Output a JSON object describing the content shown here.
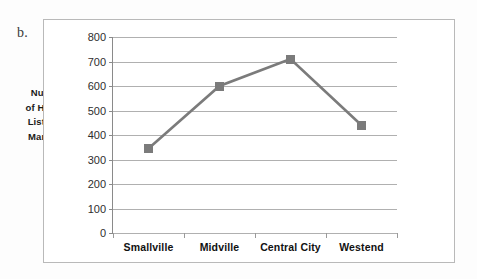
{
  "figure": {
    "item_label": "b.",
    "axis_title_lines": [
      "Number",
      "of Houses",
      "Listed  in",
      "March 09"
    ]
  },
  "chart_data": {
    "type": "line",
    "title": "",
    "xlabel": "",
    "ylabel": "Number of Houses Listed in March 09",
    "categories": [
      "Smallville",
      "Midville",
      "Central City",
      "Westend"
    ],
    "values": [
      345,
      600,
      710,
      440
    ],
    "series": [
      {
        "name": "Number of Houses Listed in March 09",
        "values": [
          345,
          600,
          710,
          440
        ]
      }
    ],
    "ylim": [
      0,
      800
    ],
    "yticks": [
      0,
      100,
      200,
      300,
      400,
      500,
      600,
      700,
      800
    ],
    "ytick_labels": [
      "0",
      "100",
      "200",
      "300",
      "400",
      "500",
      "600",
      "700",
      "800"
    ],
    "grid": true,
    "grid_axis": "y",
    "legend": false,
    "legend_position": "none",
    "marker": "square",
    "line_color": "#7b7b7b",
    "marker_color": "#7b7b7b",
    "grid_color": "#b0b0b0",
    "plot_background": "#ffffff",
    "frame_border_color": "#b9b9b9"
  }
}
